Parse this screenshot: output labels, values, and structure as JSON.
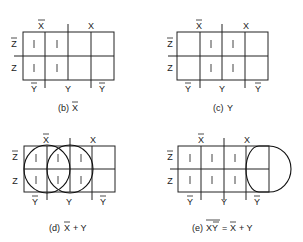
{
  "maps": [
    {
      "id": "b",
      "caption_prefix": "(b)",
      "caption_expr": "X",
      "caption_bar": "X",
      "top_labels": [
        "X̄",
        "X"
      ],
      "side_labels": [
        "Z̄",
        "Z"
      ],
      "bottom_labels": [
        "Ȳ",
        "Y",
        "Ȳ"
      ],
      "cells": [
        [
          "1",
          "1",
          "",
          ""
        ],
        [
          "1",
          "1",
          "",
          ""
        ]
      ]
    },
    {
      "id": "c",
      "caption_prefix": "(c)",
      "caption_expr": "Y",
      "top_labels": [
        "X̄",
        "X"
      ],
      "side_labels": [
        "Z̄",
        "Z"
      ],
      "bottom_labels": [
        "Ȳ",
        "Y",
        "Ȳ"
      ],
      "cells": [
        [
          "",
          "1",
          "1",
          ""
        ],
        [
          "",
          "1",
          "1",
          ""
        ]
      ]
    },
    {
      "id": "d",
      "caption_prefix": "(d)",
      "caption_expr": "X̄ + Y",
      "top_labels": [
        "X̄",
        "X"
      ],
      "side_labels": [
        "Z̄",
        "Z"
      ],
      "bottom_labels": [
        "Ȳ",
        "Y",
        "Ȳ"
      ],
      "cells": [
        [
          "1",
          "1",
          "1",
          ""
        ],
        [
          "1",
          "1",
          "1",
          ""
        ]
      ],
      "groupings": [
        "X̄ (columns 1-2)",
        "Y (columns 2-3)"
      ]
    },
    {
      "id": "e",
      "caption_prefix": "(e)",
      "caption_expr": "XȲ (complemented) = X̄ + Y",
      "caption_lhs": "XY",
      "caption_rhs": "= X + Y",
      "top_labels": [
        "X̄",
        "X"
      ],
      "side_labels": [
        "Z̄",
        "Z"
      ],
      "bottom_labels": [
        "Ȳ",
        "Y",
        "Ȳ"
      ],
      "cells": [
        [
          "1",
          "1",
          "1",
          ""
        ],
        [
          "1",
          "1",
          "1",
          ""
        ]
      ],
      "groupings": [
        "XȲ (column 4, zeros)"
      ]
    }
  ],
  "one_symbol": "1"
}
